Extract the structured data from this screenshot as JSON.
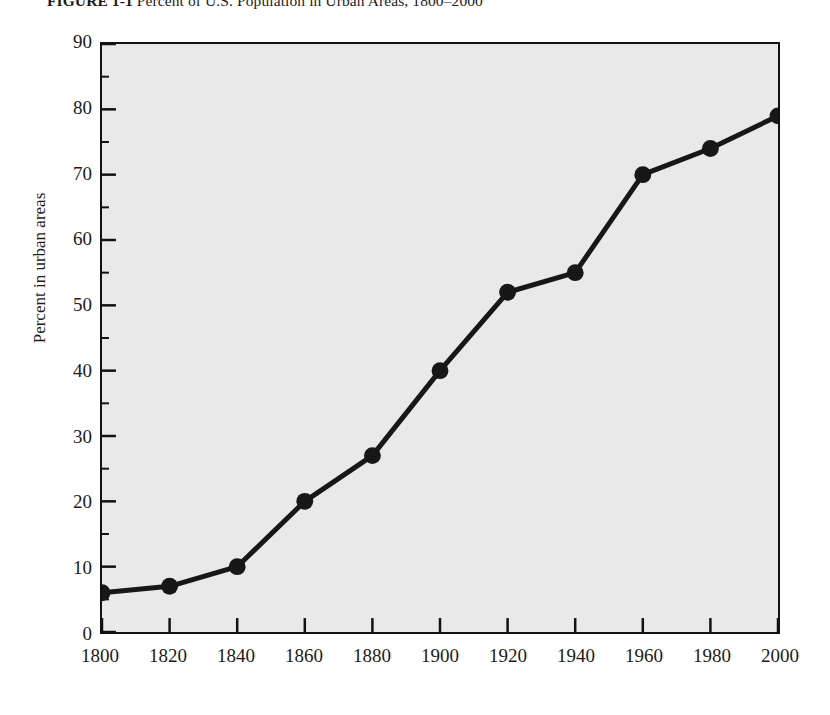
{
  "figure": {
    "caption_label": "FIGURE 1-1",
    "caption_text": "Percent of U.S. Population in Urban Areas, 1800–2000"
  },
  "chart_data": {
    "type": "line",
    "title": "Percent of U.S. Population in Urban Areas, 1800–2000",
    "xlabel": "",
    "ylabel": "Percent in urban areas",
    "x": [
      1800,
      1820,
      1840,
      1860,
      1880,
      1900,
      1920,
      1940,
      1960,
      1980,
      2000
    ],
    "values": [
      6,
      7,
      10,
      20,
      27,
      40,
      52,
      55,
      70,
      74,
      79
    ],
    "categories": [
      "1800",
      "1820",
      "1840",
      "1860",
      "1880",
      "1900",
      "1920",
      "1940",
      "1960",
      "1980",
      "2000"
    ],
    "xlim": [
      1800,
      2000
    ],
    "ylim": [
      0,
      90
    ],
    "xticks": [
      1800,
      1820,
      1840,
      1860,
      1880,
      1900,
      1920,
      1940,
      1960,
      1980,
      2000
    ],
    "xtick_labels": [
      "1800",
      "1820",
      "1840",
      "1860",
      "1880",
      "1900",
      "1920",
      "1940",
      "1960",
      "1980",
      "2000"
    ],
    "yticks": [
      0,
      10,
      20,
      30,
      40,
      50,
      60,
      70,
      80,
      90
    ],
    "ytick_labels": [
      "0",
      "10",
      "20",
      "30",
      "40",
      "50",
      "60",
      "70",
      "80",
      "90"
    ],
    "yticks_minor_step": 5,
    "grid": false,
    "legend": null,
    "series_color": "#171717",
    "marker": "circle",
    "plot_background": "#e9e9e9",
    "frame_color": "#111111"
  }
}
